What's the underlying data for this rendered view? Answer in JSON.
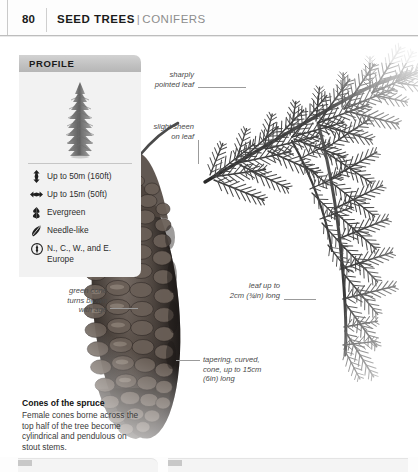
{
  "page": {
    "folio": "80",
    "running_head_primary": "SEED TREES",
    "running_head_divider": "|",
    "running_head_secondary": "CONIFERS"
  },
  "profile": {
    "header_label": "PROFILE",
    "figure_icon": "conifer-tree-silhouette",
    "specs": [
      {
        "icon": "height-arrow-icon",
        "text": "Up to 50m (160ft)"
      },
      {
        "icon": "spread-arrow-icon",
        "text": "Up to 15m (50ft)"
      },
      {
        "icon": "evergreen-leaf-icon",
        "text": "Evergreen"
      },
      {
        "icon": "needle-leaf-icon",
        "text": "Needle-like"
      },
      {
        "icon": "compass-globe-icon",
        "text": "N., C., W., and\nE. Europe"
      }
    ]
  },
  "annotations": [
    {
      "id": "sharply-pointed-leaf",
      "text": "sharply\npointed leaf"
    },
    {
      "id": "slight-sheen-on-leaf",
      "text": "slight sheen\non leaf"
    },
    {
      "id": "green-cone-turns-brown",
      "text": "green cone\nturns brown\nwith age"
    },
    {
      "id": "leaf-length",
      "text": "leaf up to\n2cm (¾in) long"
    },
    {
      "id": "cone-shape-length",
      "text": "tapering, curved,\ncone, up to 15cm\n(6in) long"
    }
  ],
  "caption": {
    "title": "Cones of the spruce",
    "body": "Female cones borne across the top half of the tree become cylindrical and pendulous on stout stems."
  },
  "colors": {
    "rule": "#bdbdbd",
    "panel_header": "#c2c2c2",
    "panel_body": "#f2f2f2",
    "annotation_text": "#4a4a4a",
    "leader_line": "#9b9b9b",
    "heading_text": "#1b1b1b",
    "secondary_text": "#8d8d8d"
  }
}
